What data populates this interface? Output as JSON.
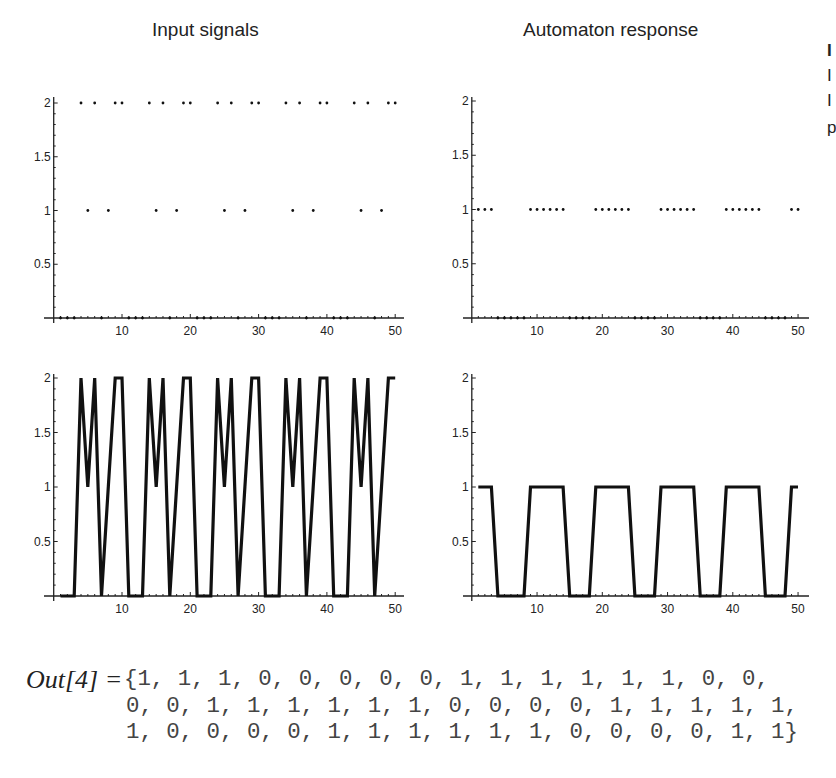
{
  "titles": {
    "left": "Input signals",
    "right": "Automaton response"
  },
  "cutoff_text": [
    "I",
    "I",
    "I",
    "p"
  ],
  "output": {
    "label": "Out[4] =",
    "lines": [
      "{1, 1, 1, 0, 0, 0, 0, 0, 1, 1, 1, 1, 1, 1, 0, 0,",
      "0, 0, 1, 1, 1, 1, 1, 1, 0, 0, 0, 0, 1, 1, 1, 1, 1,",
      "1, 0, 0, 0, 0, 1, 1, 1, 1, 1, 1, 0, 0, 0, 0, 1, 1}"
    ]
  },
  "chart_data": [
    {
      "id": "input-points",
      "type": "scatter",
      "title": "Input signals",
      "xlabel": "",
      "ylabel": "",
      "x_ticks": [
        10,
        20,
        30,
        40,
        50
      ],
      "y_ticks": [
        "0.5",
        "1",
        "1.5",
        "2"
      ],
      "xlim": [
        0,
        50
      ],
      "ylim": [
        0,
        2
      ],
      "grid": false,
      "x": [
        1,
        2,
        3,
        4,
        5,
        6,
        7,
        8,
        9,
        10,
        11,
        12,
        13,
        14,
        15,
        16,
        17,
        18,
        19,
        20,
        21,
        22,
        23,
        24,
        25,
        26,
        27,
        28,
        29,
        30,
        31,
        32,
        33,
        34,
        35,
        36,
        37,
        38,
        39,
        40,
        41,
        42,
        43,
        44,
        45,
        46,
        47,
        48,
        49,
        50
      ],
      "values": [
        0,
        0,
        0,
        2,
        1,
        2,
        0,
        1,
        2,
        2,
        0,
        0,
        0,
        2,
        1,
        2,
        0,
        1,
        2,
        2,
        0,
        0,
        0,
        2,
        1,
        2,
        0,
        1,
        2,
        2,
        0,
        0,
        0,
        2,
        1,
        2,
        0,
        1,
        2,
        2,
        0,
        0,
        0,
        2,
        1,
        2,
        0,
        1,
        2,
        2
      ],
      "frame": {
        "x0": 53.7,
        "dx": 6.83,
        "y0": 318,
        "ypu": 107.5,
        "axis_x_start": 44,
        "axis_x_end": 404,
        "axis_y_top": 97
      }
    },
    {
      "id": "response-points",
      "type": "scatter",
      "title": "Automaton response",
      "xlabel": "",
      "ylabel": "",
      "x_ticks": [
        10,
        20,
        30,
        40,
        50
      ],
      "y_ticks": [
        "0.5",
        "1",
        "1.5",
        "2"
      ],
      "xlim": [
        0,
        50
      ],
      "ylim": [
        0,
        2
      ],
      "grid": false,
      "x": [
        1,
        2,
        3,
        4,
        5,
        6,
        7,
        8,
        9,
        10,
        11,
        12,
        13,
        14,
        15,
        16,
        17,
        18,
        19,
        20,
        21,
        22,
        23,
        24,
        25,
        26,
        27,
        28,
        29,
        30,
        31,
        32,
        33,
        34,
        35,
        36,
        37,
        38,
        39,
        40,
        41,
        42,
        43,
        44,
        45,
        46,
        47,
        48,
        49,
        50
      ],
      "values": [
        1,
        1,
        1,
        0,
        0,
        0,
        0,
        0,
        1,
        1,
        1,
        1,
        1,
        1,
        0,
        0,
        0,
        0,
        1,
        1,
        1,
        1,
        1,
        1,
        0,
        0,
        0,
        0,
        1,
        1,
        1,
        1,
        1,
        1,
        0,
        0,
        0,
        0,
        1,
        1,
        1,
        1,
        1,
        1,
        0,
        0,
        0,
        0,
        1,
        1
      ],
      "frame": {
        "x0": 471.8,
        "dx": 6.525,
        "y0": 318,
        "ypu": 108.5,
        "axis_x_start": 463,
        "axis_x_end": 809,
        "axis_y_top": 97
      }
    },
    {
      "id": "input-line",
      "type": "line",
      "title": "",
      "xlabel": "",
      "ylabel": "",
      "x_ticks": [
        10,
        20,
        30,
        40,
        50
      ],
      "y_ticks": [
        "0.5",
        "1",
        "1.5",
        "2"
      ],
      "xlim": [
        0,
        50
      ],
      "ylim": [
        0,
        2
      ],
      "grid": false,
      "x": [
        1,
        2,
        3,
        4,
        5,
        6,
        7,
        8,
        9,
        10,
        11,
        12,
        13,
        14,
        15,
        16,
        17,
        18,
        19,
        20,
        21,
        22,
        23,
        24,
        25,
        26,
        27,
        28,
        29,
        30,
        31,
        32,
        33,
        34,
        35,
        36,
        37,
        38,
        39,
        40,
        41,
        42,
        43,
        44,
        45,
        46,
        47,
        48,
        49,
        50
      ],
      "values": [
        0,
        0,
        0,
        2,
        1,
        2,
        0,
        1,
        2,
        2,
        0,
        0,
        0,
        2,
        1,
        2,
        0,
        1,
        2,
        2,
        0,
        0,
        0,
        2,
        1,
        2,
        0,
        1,
        2,
        2,
        0,
        0,
        0,
        2,
        1,
        2,
        0,
        1,
        2,
        2,
        0,
        0,
        0,
        2,
        1,
        2,
        0,
        1,
        2,
        2
      ],
      "frame": {
        "x0": 53.7,
        "dx": 6.83,
        "y0": 596,
        "ypu": 109,
        "axis_x_start": 44,
        "axis_x_end": 404,
        "axis_y_top": 374
      }
    },
    {
      "id": "response-line",
      "type": "line",
      "title": "",
      "xlabel": "",
      "ylabel": "",
      "x_ticks": [
        10,
        20,
        30,
        40,
        50
      ],
      "y_ticks": [
        "0.5",
        "1",
        "1.5",
        "2"
      ],
      "xlim": [
        0,
        50
      ],
      "ylim": [
        0,
        2
      ],
      "grid": false,
      "x": [
        1,
        2,
        3,
        4,
        5,
        6,
        7,
        8,
        9,
        10,
        11,
        12,
        13,
        14,
        15,
        16,
        17,
        18,
        19,
        20,
        21,
        22,
        23,
        24,
        25,
        26,
        27,
        28,
        29,
        30,
        31,
        32,
        33,
        34,
        35,
        36,
        37,
        38,
        39,
        40,
        41,
        42,
        43,
        44,
        45,
        46,
        47,
        48,
        49,
        50
      ],
      "values": [
        1,
        1,
        1,
        0,
        0,
        0,
        0,
        0,
        1,
        1,
        1,
        1,
        1,
        1,
        0,
        0,
        0,
        0,
        1,
        1,
        1,
        1,
        1,
        1,
        0,
        0,
        0,
        0,
        1,
        1,
        1,
        1,
        1,
        1,
        0,
        0,
        0,
        0,
        1,
        1,
        1,
        1,
        1,
        1,
        0,
        0,
        0,
        0,
        1,
        1
      ],
      "frame": {
        "x0": 471.8,
        "dx": 6.525,
        "y0": 596,
        "ypu": 109,
        "axis_x_start": 463,
        "axis_x_end": 809,
        "axis_y_top": 374
      }
    }
  ]
}
